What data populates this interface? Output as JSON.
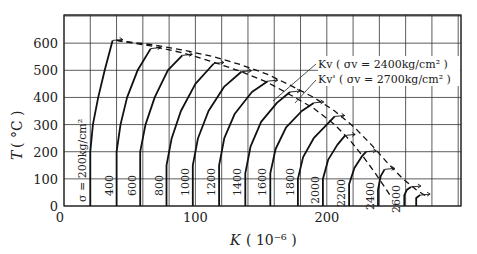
{
  "chart_data": {
    "type": "line",
    "title": "",
    "xlabel": "K (10^-6)",
    "ylabel": "T (°C)",
    "xlim": [
      0,
      300
    ],
    "ylim": [
      0,
      700
    ],
    "grid": true,
    "x_ticks": [
      "0",
      "100",
      "200"
    ],
    "y_ticks": [
      "0",
      "100",
      "200",
      "300",
      "400",
      "500",
      "600"
    ],
    "series": [
      {
        "name": "σ=200kg/cm²",
        "label": "σ = 200kg/cm²",
        "points": [
          [
            20,
            0
          ],
          [
            20,
            200
          ],
          [
            22,
            300
          ],
          [
            26,
            400
          ],
          [
            31,
            500
          ],
          [
            37,
            610
          ]
        ]
      },
      {
        "name": "400",
        "label": "400",
        "points": [
          [
            40,
            0
          ],
          [
            40,
            200
          ],
          [
            43,
            300
          ],
          [
            48,
            400
          ],
          [
            56,
            500
          ],
          [
            66,
            580
          ]
        ]
      },
      {
        "name": "600",
        "label": "600",
        "points": [
          [
            58,
            0
          ],
          [
            58,
            200
          ],
          [
            62,
            300
          ],
          [
            69,
            400
          ],
          [
            79,
            500
          ],
          [
            90,
            555
          ]
        ]
      },
      {
        "name": "800",
        "label": "800",
        "points": [
          [
            78,
            0
          ],
          [
            78,
            150
          ],
          [
            82,
            250
          ],
          [
            89,
            350
          ],
          [
            100,
            450
          ],
          [
            114,
            525
          ]
        ]
      },
      {
        "name": "1000",
        "label": "1000",
        "points": [
          [
            98,
            0
          ],
          [
            98,
            150
          ],
          [
            102,
            250
          ],
          [
            110,
            350
          ],
          [
            122,
            440
          ],
          [
            135,
            495
          ]
        ]
      },
      {
        "name": "1200",
        "label": "1200",
        "points": [
          [
            118,
            0
          ],
          [
            118,
            150
          ],
          [
            122,
            250
          ],
          [
            130,
            340
          ],
          [
            143,
            420
          ],
          [
            155,
            460
          ]
        ]
      },
      {
        "name": "1400",
        "label": "1400",
        "points": [
          [
            138,
            0
          ],
          [
            138,
            120
          ],
          [
            142,
            220
          ],
          [
            150,
            310
          ],
          [
            162,
            380
          ],
          [
            172,
            420
          ]
        ]
      },
      {
        "name": "1600",
        "label": "1600",
        "points": [
          [
            157,
            0
          ],
          [
            157,
            120
          ],
          [
            161,
            210
          ],
          [
            169,
            290
          ],
          [
            181,
            350
          ],
          [
            190,
            380
          ]
        ]
      },
      {
        "name": "1800",
        "label": "1800",
        "points": [
          [
            178,
            0
          ],
          [
            178,
            100
          ],
          [
            182,
            180
          ],
          [
            190,
            250
          ],
          [
            200,
            300
          ],
          [
            206,
            330
          ]
        ]
      },
      {
        "name": "2000",
        "label": "2000",
        "points": [
          [
            197,
            0
          ],
          [
            197,
            100
          ],
          [
            201,
            170
          ],
          [
            208,
            225
          ],
          [
            214,
            260
          ]
        ]
      },
      {
        "name": "2200",
        "label": "2200",
        "points": [
          [
            217,
            0
          ],
          [
            217,
            80
          ],
          [
            221,
            140
          ],
          [
            227,
            185
          ],
          [
            230,
            200
          ]
        ]
      },
      {
        "name": "2400",
        "label": "2400",
        "points": [
          [
            239,
            0
          ],
          [
            239,
            60
          ],
          [
            241,
            110
          ],
          [
            244,
            135
          ]
        ]
      },
      {
        "name": "2600",
        "label": "2600",
        "points": [
          [
            259,
            0
          ],
          [
            259,
            40
          ],
          [
            261,
            60
          ],
          [
            264,
            70
          ]
        ]
      },
      {
        "name": "end",
        "label": "",
        "points": [
          [
            268,
            0
          ],
          [
            268,
            30
          ],
          [
            271,
            40
          ]
        ]
      }
    ],
    "envelopes": [
      {
        "name": "Kv (σv=2400kg/cm²)",
        "style": "dashed",
        "points": [
          [
            40,
            610
          ],
          [
            66,
            595
          ],
          [
            90,
            575
          ],
          [
            114,
            550
          ],
          [
            135,
            520
          ],
          [
            155,
            485
          ],
          [
            172,
            445
          ],
          [
            190,
            400
          ],
          [
            206,
            350
          ],
          [
            221,
            290
          ],
          [
            234,
            225
          ],
          [
            246,
            160
          ],
          [
            258,
            100
          ],
          [
            268,
            60
          ],
          [
            276,
            35
          ]
        ]
      },
      {
        "name": "Kv' (σv=2700kg/cm²)",
        "style": "dashed",
        "points": [
          [
            40,
            610
          ],
          [
            66,
            590
          ],
          [
            90,
            565
          ],
          [
            114,
            530
          ],
          [
            135,
            495
          ],
          [
            155,
            455
          ],
          [
            172,
            410
          ],
          [
            190,
            360
          ],
          [
            206,
            300
          ],
          [
            218,
            240
          ],
          [
            228,
            180
          ],
          [
            237,
            120
          ],
          [
            244,
            70
          ],
          [
            248,
            40
          ]
        ]
      }
    ],
    "legend": [
      "Kv ( σv = 2400kg/cm² )",
      "Kv' ( σv = 2700kg/cm² )"
    ]
  },
  "axes": {
    "y_title": "T",
    "y_unit": "( °C )",
    "x_title": "K",
    "x_unit": "( 10⁻⁶ )",
    "origin_y": "0",
    "origin_x": "0"
  }
}
